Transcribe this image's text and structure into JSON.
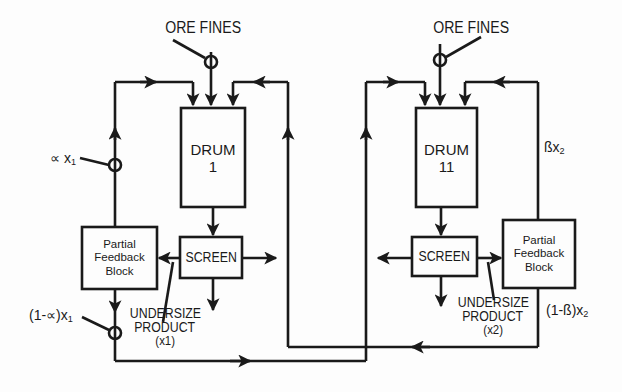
{
  "diagram": {
    "type": "process-flow",
    "nodes": {
      "ore_fines_1": {
        "label": "ORE FINES"
      },
      "ore_fines_2": {
        "label": "ORE FINES"
      },
      "drum_1": {
        "line1": "DRUM",
        "line2": "1"
      },
      "drum_2": {
        "line1": "DRUM",
        "line2": "11"
      },
      "screen_1": {
        "label": "SCREEN"
      },
      "screen_2": {
        "label": "SCREEN"
      },
      "feedback_1": {
        "line1": "Partial",
        "line2": "Feedback",
        "line3": "Block"
      },
      "feedback_2": {
        "line1": "Partial",
        "line2": "Feedback",
        "line3": "Block"
      },
      "undersize_1": {
        "line1": "UNDERSIZE",
        "line2": "PRODUCT",
        "line3": "(x1)"
      },
      "undersize_2": {
        "line1": "UNDERSIZE",
        "line2": "PRODUCT",
        "line3": "(x2)"
      }
    },
    "flow_labels": {
      "alpha_x1": "∝ x",
      "alpha_x1_sub": "1",
      "one_minus_alpha_x1": "(1-∝)x",
      "one_minus_alpha_x1_sub": "1",
      "beta_x2": "ßx",
      "beta_x2_sub": "2",
      "one_minus_beta_x2": "(1-ß)x",
      "one_minus_beta_x2_sub": "2"
    },
    "edges": [
      {
        "from": "ore_fines_1",
        "to": "drum_1"
      },
      {
        "from": "feedback_1",
        "to": "drum_1",
        "label": "alpha_x1"
      },
      {
        "from": "feedback_1",
        "to": "drum_2",
        "label": "one_minus_alpha_x1"
      },
      {
        "from": "drum_1",
        "to": "screen_1"
      },
      {
        "from": "screen_1",
        "to": "feedback_1"
      },
      {
        "from": "screen_1",
        "to": "undersize_1"
      },
      {
        "from": "screen_1",
        "to": "right (oversize out)"
      },
      {
        "from": "ore_fines_2",
        "to": "drum_2"
      },
      {
        "from": "feedback_2",
        "to": "drum_2",
        "label": "beta_x2"
      },
      {
        "from": "feedback_2",
        "to": "drum_1",
        "label": "one_minus_beta_x2"
      },
      {
        "from": "drum_2",
        "to": "screen_2"
      },
      {
        "from": "screen_2",
        "to": "feedback_2"
      },
      {
        "from": "screen_2",
        "to": "undersize_2"
      },
      {
        "from": "screen_2",
        "to": "left (oversize out)"
      }
    ],
    "colors": {
      "line": "#1a1a1a",
      "background": "#fdfdfd"
    }
  }
}
